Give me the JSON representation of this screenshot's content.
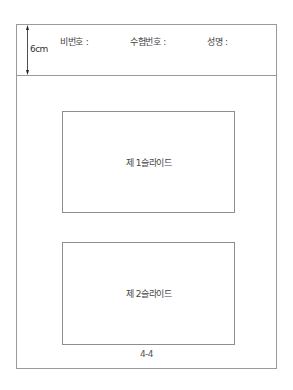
{
  "header": {
    "dimension_label": "6cm",
    "fields": [
      {
        "label": "비번호 :"
      },
      {
        "label": "수험번호 :"
      },
      {
        "label": "성명 :"
      }
    ]
  },
  "slides": [
    {
      "label": "제 1슬라이드"
    },
    {
      "label": "제 2슬라이드"
    }
  ],
  "footer": {
    "page_number": "4-4"
  },
  "colors": {
    "border": "#9a9a9a",
    "text": "#444444",
    "background": "#ffffff"
  }
}
